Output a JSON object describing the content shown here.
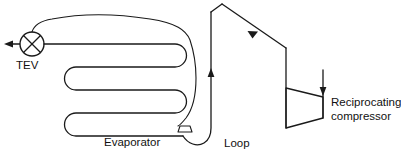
{
  "diagram": {
    "background_color": "#ffffff",
    "line_color": "#1a1a1a",
    "labels": {
      "tev": "TEV",
      "evaporator": "Evaporator",
      "loop": "Loop",
      "compressor_line1": "Reciprocating",
      "compressor_line2": "compressor"
    },
    "components": [
      {
        "name": "tev-valve",
        "type": "valve",
        "symbol": "circle-with-x",
        "label": "TEV",
        "cx": 32,
        "cy": 44,
        "r": 12
      },
      {
        "name": "evaporator-coil",
        "type": "serpentine-coil",
        "passes": 4,
        "label": "Evaporator"
      },
      {
        "name": "sensing-bulb",
        "type": "bulb",
        "label": ""
      },
      {
        "name": "external-equalizer-line",
        "type": "capillary-line",
        "label": ""
      },
      {
        "name": "suction-loop",
        "type": "u-bend",
        "label": "Loop"
      },
      {
        "name": "reciprocating-compressor",
        "type": "trapezoid",
        "label": "Reciprocating compressor"
      }
    ],
    "flow_arrows": [
      {
        "name": "liquid-outlet-arrow",
        "direction": "left"
      },
      {
        "name": "loop-riser-arrow",
        "direction": "up"
      },
      {
        "name": "suction-diagonal-arrow",
        "direction": "down-right"
      },
      {
        "name": "compressor-discharge-arrow",
        "direction": "down"
      }
    ]
  }
}
